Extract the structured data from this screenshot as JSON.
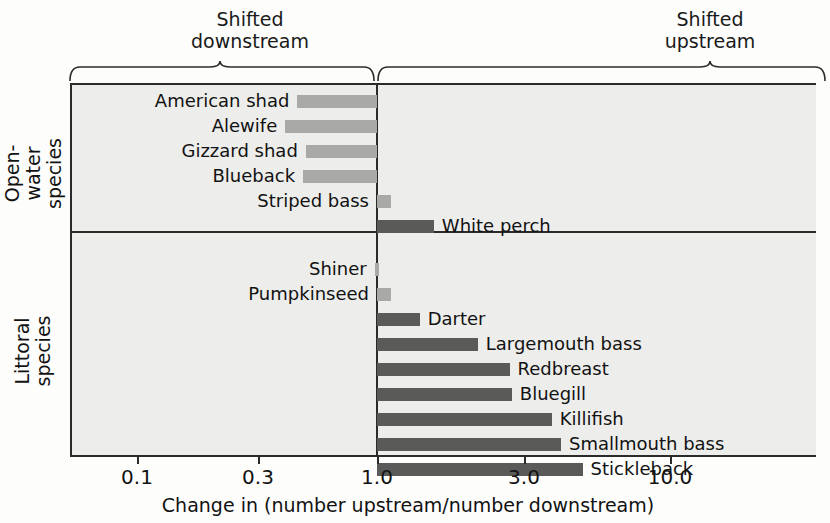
{
  "headings": {
    "left": "Shifted\ndownstream",
    "right": "Shifted\nupstream"
  },
  "groups": [
    {
      "id": "open-water",
      "label": "Open-water\nspecies"
    },
    {
      "id": "littoral",
      "label": "Littoral\nspecies"
    }
  ],
  "axis": {
    "title": "Change in (number upstream/number downstream)",
    "ticks": [
      "0.1",
      "0.3",
      "1.0",
      "3.0",
      "10.0"
    ]
  },
  "colors": {
    "downstream_bar": "#a9a9a7",
    "upstream_bar": "#5a5a58",
    "plot_background": "#ededeb",
    "frame": "#2b2b2b"
  },
  "chart_data": {
    "type": "bar",
    "title": "",
    "xlabel": "Change in (number upstream/number downstream)",
    "ylabel": "",
    "orientation": "horizontal",
    "xscale": "log",
    "xlim": [
      0.075,
      22
    ],
    "xticks": [
      0.1,
      0.3,
      1.0,
      3.0,
      10.0
    ],
    "xticklabels": [
      "0.1",
      "0.3",
      "1.0",
      "3.0",
      "10.0"
    ],
    "reference_line": 1.0,
    "grid": false,
    "legend": null,
    "annotations": [
      "Shifted downstream",
      "Shifted upstream"
    ],
    "groups": [
      "Open-water species",
      "Littoral species"
    ],
    "categories": [
      "American shad",
      "Alewife",
      "Gizzard shad",
      "Blueback",
      "Striped bass",
      "White perch",
      "Shiner",
      "Pumpkinseed",
      "Darter",
      "Largemouth bass",
      "Redbreast",
      "Bluegill",
      "Killifish",
      "Smallmouth bass",
      "Stickleback"
    ],
    "values": [
      0.4,
      0.36,
      0.43,
      0.42,
      0.9,
      1.3,
      0.78,
      0.9,
      1.15,
      1.9,
      2.5,
      2.55,
      3.6,
      3.9,
      4.7
    ],
    "bars": [
      {
        "name": "American shad",
        "group": "open-water",
        "value": 0.4,
        "direction": "downstream"
      },
      {
        "name": "Alewife",
        "group": "open-water",
        "value": 0.36,
        "direction": "downstream"
      },
      {
        "name": "Gizzard shad",
        "group": "open-water",
        "value": 0.43,
        "direction": "downstream"
      },
      {
        "name": "Blueback",
        "group": "open-water",
        "value": 0.42,
        "direction": "downstream"
      },
      {
        "name": "Striped bass",
        "group": "open-water",
        "value": 0.9,
        "direction": "downstream"
      },
      {
        "name": "White perch",
        "group": "open-water",
        "value": 1.3,
        "direction": "upstream"
      },
      {
        "name": "Shiner",
        "group": "littoral",
        "value": 0.78,
        "direction": "downstream"
      },
      {
        "name": "Pumpkinseed",
        "group": "littoral",
        "value": 0.9,
        "direction": "downstream"
      },
      {
        "name": "Darter",
        "group": "littoral",
        "value": 1.15,
        "direction": "upstream"
      },
      {
        "name": "Largemouth bass",
        "group": "littoral",
        "value": 1.9,
        "direction": "upstream"
      },
      {
        "name": "Redbreast",
        "group": "littoral",
        "value": 2.5,
        "direction": "upstream"
      },
      {
        "name": "Bluegill",
        "group": "littoral",
        "value": 2.55,
        "direction": "upstream"
      },
      {
        "name": "Killifish",
        "group": "littoral",
        "value": 3.6,
        "direction": "upstream"
      },
      {
        "name": "Smallmouth bass",
        "group": "littoral",
        "value": 3.9,
        "direction": "upstream"
      },
      {
        "name": "Stickleback",
        "group": "littoral",
        "value": 4.7,
        "direction": "upstream"
      }
    ]
  },
  "layout": {
    "plot_left": 70,
    "plot_right": 816,
    "plot_top": 83,
    "axis_y": 455,
    "divider_y": 231,
    "zero_x": 377,
    "row_height": 25,
    "first_row_center": 101,
    "bar_height": 13,
    "tick_positions": [
      137,
      258,
      377,
      524,
      670
    ]
  }
}
